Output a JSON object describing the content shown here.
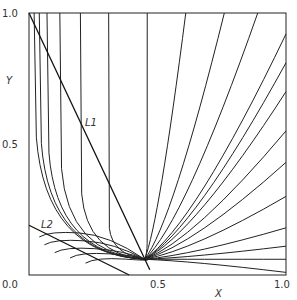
{
  "chart_data": {
    "type": "line",
    "title": "",
    "xlabel": "X",
    "ylabel": "Y",
    "xlim": [
      0.0,
      1.0
    ],
    "ylim": [
      0.0,
      1.0
    ],
    "grid": false,
    "tick_labels": {
      "x": [
        "0.0",
        "0.5",
        "1.0"
      ],
      "y": [
        "0.0",
        "0.5",
        "1.0"
      ]
    },
    "node": {
      "x": 0.45,
      "y": 0.06
    },
    "annotations": [
      {
        "text": "L1",
        "x": 0.24,
        "y": 0.53
      },
      {
        "text": "L2",
        "x": 0.05,
        "y": 0.2
      }
    ],
    "lines": [
      {
        "name": "L1",
        "x": [
          0.0,
          0.47
        ],
        "y": [
          1.0,
          0.02
        ]
      },
      {
        "name": "L2",
        "x": [
          0.0,
          0.39
        ],
        "y": [
          0.19,
          0.0
        ]
      }
    ],
    "trajectories": [
      {
        "start": [
          0.02,
          1.0
        ]
      },
      {
        "start": [
          0.04,
          1.0
        ]
      },
      {
        "start": [
          0.07,
          1.0
        ]
      },
      {
        "start": [
          0.12,
          1.0
        ]
      },
      {
        "start": [
          0.2,
          1.0
        ]
      },
      {
        "start": [
          0.31,
          1.0
        ]
      },
      {
        "start": [
          0.46,
          1.0
        ]
      },
      {
        "start": [
          0.61,
          1.0
        ]
      },
      {
        "start": [
          0.76,
          1.0
        ]
      },
      {
        "start": [
          0.89,
          1.0
        ]
      },
      {
        "start": [
          1.0,
          0.92
        ]
      },
      {
        "start": [
          1.0,
          0.81
        ]
      },
      {
        "start": [
          1.0,
          0.7
        ]
      },
      {
        "start": [
          1.0,
          0.55
        ]
      },
      {
        "start": [
          1.0,
          0.43
        ]
      },
      {
        "start": [
          1.0,
          0.3
        ]
      },
      {
        "start": [
          1.0,
          0.18
        ]
      },
      {
        "start": [
          1.0,
          0.11
        ]
      },
      {
        "start": [
          1.0,
          0.06
        ]
      },
      {
        "start": [
          1.0,
          0.01
        ]
      },
      {
        "start": [
          0.04,
          0.13
        ]
      },
      {
        "start": [
          0.06,
          0.1
        ]
      },
      {
        "start": [
          0.1,
          0.07
        ]
      },
      {
        "start": [
          0.16,
          0.05
        ]
      },
      {
        "start": [
          0.22,
          0.03
        ]
      }
    ]
  }
}
